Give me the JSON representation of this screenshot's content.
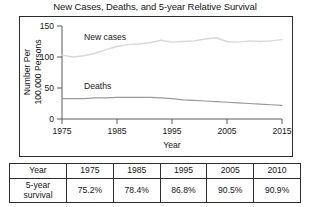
{
  "chart_data": {
    "type": "line",
    "title": "New Cases, Deaths, and 5-year Relative Survival",
    "xlabel": "Year",
    "ylabel": "Number Per 100,000 Persons",
    "xlim": [
      1975,
      2015
    ],
    "ylim": [
      0,
      150
    ],
    "xticks": [
      "1975",
      "1985",
      "1995",
      "2005",
      "2015"
    ],
    "yticks": [
      "0",
      "50",
      "100",
      "150"
    ],
    "grid": false,
    "legend_position": "inline-labels",
    "series": [
      {
        "name": "New cases",
        "color": "#d8d8d8",
        "label_x": 1979,
        "label_y": 128,
        "x": [
          1975,
          1977,
          1979,
          1981,
          1983,
          1985,
          1987,
          1989,
          1991,
          1993,
          1995,
          1997,
          1999,
          2001,
          2003,
          2005,
          2007,
          2009,
          2011,
          2013,
          2015
        ],
        "values": [
          103,
          100,
          102,
          106,
          112,
          117,
          120,
          121,
          123,
          127,
          124,
          125,
          126,
          129,
          131,
          125,
          124,
          126,
          125,
          126,
          128
        ]
      },
      {
        "name": "Deaths",
        "color": "#9a9a9a",
        "label_x": 1979,
        "label_y": 48,
        "x": [
          1975,
          1977,
          1979,
          1981,
          1983,
          1985,
          1987,
          1989,
          1991,
          1993,
          1995,
          1997,
          1999,
          2001,
          2003,
          2005,
          2007,
          2009,
          2011,
          2013,
          2015
        ],
        "values": [
          33,
          33,
          33,
          34,
          34,
          35,
          35,
          35,
          35,
          34,
          33,
          31,
          30,
          29,
          28,
          27,
          26,
          25,
          24,
          23,
          22
        ]
      }
    ]
  },
  "table": {
    "header": [
      "Year",
      "1975",
      "1985",
      "1995",
      "2005",
      "2010"
    ],
    "row_label": "5-year survival",
    "row_label_line1": "5-year",
    "row_label_line2": "survival",
    "values": [
      "75.2%",
      "78.4%",
      "86.8%",
      "90.5%",
      "90.9%"
    ]
  }
}
